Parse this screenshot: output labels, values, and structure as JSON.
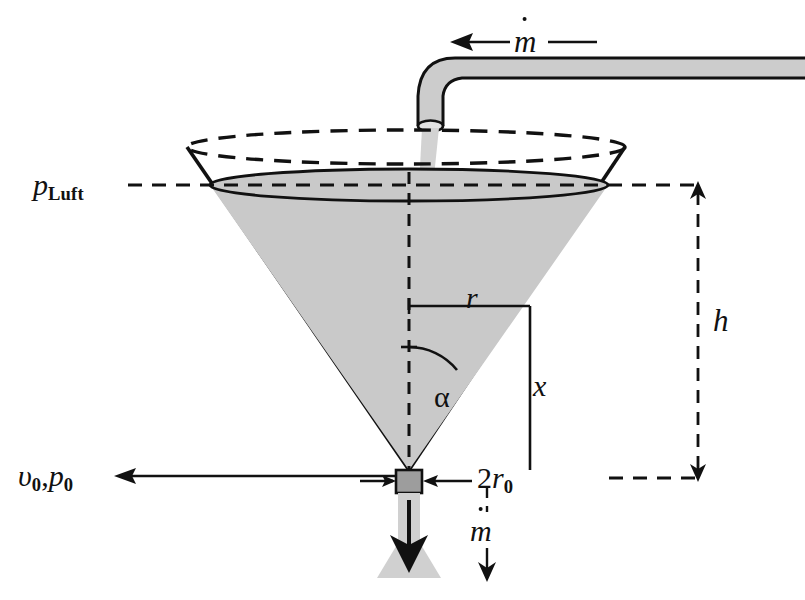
{
  "figure": {
    "type": "engineering-schematic"
  },
  "colors": {
    "liquid_fill": "#c9c9c9",
    "pipe_fill": "#cccccc",
    "stream_fill": "#d2d2d2",
    "nozzle_fill": "#9d9d9d",
    "spray_fill": "#d0d0d0",
    "line": "#111111",
    "background": "#ffffff"
  },
  "labels": {
    "mdot_top": {
      "symbol": "m",
      "accent": "dot",
      "meaning": "mass-flow-rate-inflow"
    },
    "p_luft": {
      "base": "p",
      "subscript": "Luft",
      "meaning": "ambient-air-pressure"
    },
    "r": {
      "symbol": "r",
      "meaning": "local-radius"
    },
    "x": {
      "symbol": "x",
      "meaning": "height-above-outlet"
    },
    "alpha": {
      "symbol": "α",
      "meaning": "cone-half-angle"
    },
    "h": {
      "symbol": "h",
      "meaning": "liquid-height"
    },
    "v0_p0": {
      "base_v": "υ",
      "sub_v": "0",
      "separator": ",",
      "base_p": "p",
      "sub_p": "0",
      "meaning": "outlet-velocity-and-pressure"
    },
    "two_r0": {
      "coefficient": "2",
      "base": "r",
      "subscript": "0",
      "meaning": "outlet-diameter"
    },
    "mdot_bottom": {
      "symbol": "m",
      "accent": "dot",
      "meaning": "mass-flow-rate-outflow"
    }
  },
  "geometry": {
    "cone": {
      "rim_left_x": 187,
      "rim_right_x": 625,
      "rim_y": 147,
      "rim_ellipse_ry": 17,
      "surface_left_x": 210,
      "surface_right_x": 608,
      "surface_y": 185,
      "surface_ellipse_ry": 16,
      "apex_x": 409,
      "apex_y": 470
    },
    "nozzle": {
      "x": 396,
      "y": 470,
      "width": 26,
      "height": 22
    },
    "pipe": {
      "horizontal_y": 62,
      "bend_x": 418,
      "outlet_y": 125,
      "right_edge_x": 805
    },
    "dimension_h": {
      "top_y": 185,
      "bottom_y": 478,
      "x": 698
    },
    "annotations": {
      "r_line_y": 306,
      "x_line_x": 567,
      "alpha_arc_radius": 62
    }
  }
}
